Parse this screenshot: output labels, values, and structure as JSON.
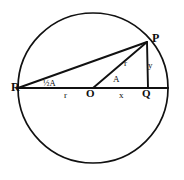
{
  "figure": {
    "type": "geometry-diagram",
    "background_color": "#ffffff",
    "stroke_color": "#111111",
    "circle": {
      "center_label": "O",
      "center_x": 93,
      "center_y": 88,
      "radius": 75
    },
    "points": [
      {
        "id": "R",
        "label": "R",
        "x": 18,
        "y": 88,
        "label_x": 14,
        "label_y": 82
      },
      {
        "id": "O",
        "label": "O",
        "x": 93,
        "y": 88,
        "label_x": 88,
        "label_y": 89
      },
      {
        "id": "Q",
        "label": "Q",
        "x": 148,
        "y": 88,
        "label_x": 143,
        "label_y": 89
      },
      {
        "id": "P",
        "label": "P",
        "x": 147,
        "y": 42,
        "label_x": 152,
        "label_y": 33
      }
    ],
    "segments": [
      {
        "id": "RQ",
        "kind": "diameter-extended",
        "from": "R",
        "to": "Q"
      },
      {
        "id": "RP",
        "kind": "chord",
        "from": "R",
        "to": "P"
      },
      {
        "id": "OP",
        "kind": "radius",
        "from": "O",
        "to": "P"
      },
      {
        "id": "PQ",
        "kind": "perpendicular",
        "from": "P",
        "to": "Q"
      }
    ],
    "segment_labels": [
      {
        "id": "RO",
        "text": "r",
        "x": 64,
        "y": 92
      },
      {
        "id": "OQ",
        "text": "x",
        "x": 120,
        "y": 92
      },
      {
        "id": "OP",
        "text": "r",
        "x": 125,
        "y": 60
      },
      {
        "id": "PQ",
        "text": "y",
        "x": 149,
        "y": 62
      }
    ],
    "angle_labels": [
      {
        "id": "angle-at-R",
        "text": "½A",
        "x": 44,
        "y": 80,
        "vertex": "R"
      },
      {
        "id": "angle-at-O",
        "text": "A",
        "x": 114,
        "y": 76,
        "vertex": "O"
      }
    ]
  }
}
